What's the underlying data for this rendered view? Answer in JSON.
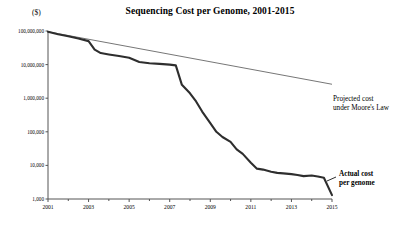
{
  "chart_data": {
    "type": "line",
    "title": "Sequencing Cost per Genome, 2001-2015",
    "unit_label": "($)",
    "xlabel": "",
    "ylabel": "",
    "yscale": "log",
    "ylim": [
      1000,
      100000000
    ],
    "xlim": [
      2001,
      2015
    ],
    "grid": false,
    "legend_position": "inline-annotations",
    "ytick_labels": [
      "100,000,000",
      "10,000,000",
      "1,000,000",
      "100,000",
      "10,000",
      "1,000"
    ],
    "ytick_values": [
      100000000,
      10000000,
      1000000,
      100000,
      10000,
      1000
    ],
    "xtick_labels": [
      "2001",
      "2003",
      "2005",
      "2007",
      "2009",
      "2011",
      "2013",
      "2015"
    ],
    "xtick_values": [
      2001,
      2003,
      2005,
      2007,
      2009,
      2011,
      2013,
      2015
    ],
    "series": [
      {
        "name": "Actual cost per genome",
        "annotation_line1": "Actual cost",
        "annotation_line2": "per genome",
        "color": "#333333",
        "style": "solid-thick",
        "x": [
          2001.0,
          2001.5,
          2002.0,
          2002.5,
          2003.0,
          2003.3,
          2003.6,
          2004.0,
          2004.5,
          2005.0,
          2005.5,
          2006.0,
          2006.5,
          2007.0,
          2007.3,
          2007.6,
          2008.0,
          2008.3,
          2008.6,
          2009.0,
          2009.3,
          2009.6,
          2010.0,
          2010.3,
          2010.6,
          2011.0,
          2011.3,
          2011.6,
          2012.0,
          2012.3,
          2012.6,
          2013.0,
          2013.3,
          2013.6,
          2014.0,
          2014.3,
          2014.6,
          2015.0
        ],
        "y": [
          95000000,
          80000000,
          70000000,
          60000000,
          50000000,
          28000000,
          22000000,
          20000000,
          18000000,
          16000000,
          12000000,
          11000000,
          10500000,
          10000000,
          9500000,
          2500000,
          1400000,
          800000,
          400000,
          180000,
          100000,
          70000,
          50000,
          30000,
          22000,
          12000,
          8000,
          7500,
          6500,
          6000,
          5800,
          5500,
          5200,
          4800,
          5000,
          4700,
          4300,
          1300
        ]
      },
      {
        "name": "Projected cost under Moore's Law",
        "annotation_line1": "Projected cost",
        "annotation_line2": "under Moore's Law",
        "color": "#555555",
        "style": "solid-thin",
        "x": [
          2001.0,
          2015.0
        ],
        "y": [
          95000000,
          2600000
        ]
      }
    ]
  }
}
